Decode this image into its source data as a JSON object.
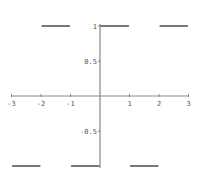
{
  "chart_data": {
    "type": "line",
    "title": "",
    "xlabel": "",
    "ylabel": "",
    "xlim": [
      -3,
      3
    ],
    "ylim": [
      -1,
      1
    ],
    "grid": false,
    "legend": null,
    "x_ticks": [
      -3,
      -2,
      -1,
      1,
      2,
      3
    ],
    "x_tick_labels": [
      "-3",
      "-2",
      "-1",
      "1",
      "2",
      "3"
    ],
    "y_ticks": [
      1,
      0.5,
      -0.5
    ],
    "y_tick_labels": [
      "1",
      "0.5",
      "-0.5"
    ],
    "series": [
      {
        "name": "square wave",
        "style": "horizontal segments",
        "segments": [
          {
            "x": [
              -3,
              -2
            ],
            "y": -1
          },
          {
            "x": [
              -2,
              -1
            ],
            "y": 1
          },
          {
            "x": [
              -1,
              0
            ],
            "y": -1
          },
          {
            "x": [
              0,
              1
            ],
            "y": 1
          },
          {
            "x": [
              1,
              2
            ],
            "y": -1
          },
          {
            "x": [
              2,
              3
            ],
            "y": 1
          }
        ]
      }
    ],
    "colors": {
      "line": "#555555",
      "axes": "#888888",
      "text": "#555555"
    }
  }
}
